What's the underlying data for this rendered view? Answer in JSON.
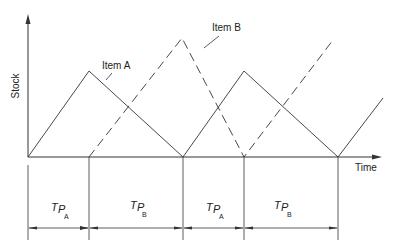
{
  "diagram": {
    "type": "inventory-cycle-diagram",
    "y_axis_label": "Stock",
    "x_axis_label": "Time",
    "series": [
      {
        "name": "Item A",
        "label": "Item A",
        "style": "solid",
        "points": [
          [
            28,
            157
          ],
          [
            89,
            71
          ],
          [
            183,
            157
          ],
          [
            244,
            71
          ],
          [
            338,
            157
          ],
          [
            383,
            98
          ]
        ]
      },
      {
        "name": "Item B",
        "label": "Item B",
        "style": "dashed",
        "points": [
          [
            89,
            157
          ],
          [
            182,
            38
          ],
          [
            244,
            157
          ],
          [
            333,
            40
          ]
        ]
      }
    ],
    "periods": [
      {
        "symbol": "T",
        "p": "P",
        "subscript": "A",
        "start": 28,
        "end": 89
      },
      {
        "symbol": "T",
        "p": "P",
        "subscript": "B",
        "start": 89,
        "end": 183
      },
      {
        "symbol": "T",
        "p": "P",
        "subscript": "A",
        "start": 183,
        "end": 244
      },
      {
        "symbol": "T",
        "p": "P",
        "subscript": "B",
        "start": 244,
        "end": 338
      }
    ],
    "colors": {
      "line": "#333333",
      "background": "#ffffff"
    }
  }
}
